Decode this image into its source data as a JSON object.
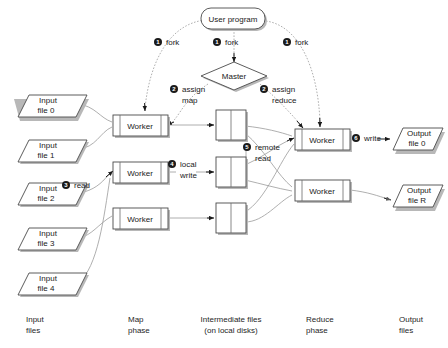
{
  "diagram": {
    "nodes": {
      "user_program": {
        "label": "User program",
        "shape": "rounded-rect"
      },
      "master": {
        "label": "Master",
        "shape": "diamond"
      },
      "input_files": [
        {
          "label_line1": "Input",
          "label_line2": "file 0"
        },
        {
          "label_line1": "Input",
          "label_line2": "file 1"
        },
        {
          "label_line1": "Input",
          "label_line2": "file 2"
        },
        {
          "label_line1": "Input",
          "label_line2": "file 3"
        },
        {
          "label_line1": "Input",
          "label_line2": "file 4"
        }
      ],
      "map_workers": [
        {
          "label": "Worker"
        },
        {
          "label": "Worker"
        },
        {
          "label": "Worker"
        }
      ],
      "intermediate_files": [
        {
          "label": ""
        },
        {
          "label": ""
        },
        {
          "label": ""
        }
      ],
      "reduce_workers": [
        {
          "label": "Worker"
        },
        {
          "label": "Worker"
        }
      ],
      "output_files": [
        {
          "label_line1": "Output",
          "label_line2": "file 0"
        },
        {
          "label_line1": "Output",
          "label_line2": "file R"
        }
      ]
    },
    "steps": [
      {
        "num": "1",
        "label_line1": "fork",
        "label_line2": ""
      },
      {
        "num": "1",
        "label_line1": "fork",
        "label_line2": ""
      },
      {
        "num": "1",
        "label_line1": "fork",
        "label_line2": ""
      },
      {
        "num": "2",
        "label_line1": "assign",
        "label_line2": "map"
      },
      {
        "num": "2",
        "label_line1": "assign",
        "label_line2": "reduce"
      },
      {
        "num": "3",
        "label_line1": "read",
        "label_line2": ""
      },
      {
        "num": "4",
        "label_line1": "local",
        "label_line2": "write"
      },
      {
        "num": "5",
        "label_line1": "remote",
        "label_line2": "read"
      },
      {
        "num": "6",
        "label_line1": "write",
        "label_line2": ""
      }
    ],
    "column_labels": [
      {
        "line1": "Input",
        "line2": "files"
      },
      {
        "line1": "Map",
        "line2": "phase"
      },
      {
        "line1": "Intermediate files",
        "line2": "(on local disks)"
      },
      {
        "line1": "Reduce",
        "line2": "phase"
      },
      {
        "line1": "Output",
        "line2": "files"
      }
    ],
    "colors": {
      "background": "#ffffff",
      "shape_stroke": "#4a4a4a",
      "shape_fill": "#ffffff",
      "shadow": "#b8b8b8",
      "connector": "#9a9a9a",
      "arrow": "#1a1a1a",
      "text": "#1a1a1a",
      "badge": "#1a1a1a"
    }
  }
}
